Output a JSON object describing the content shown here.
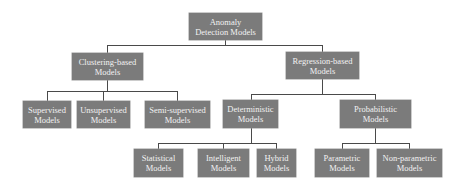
{
  "diagram": {
    "type": "tree",
    "root": {
      "id": "root",
      "line1": "Anomaly",
      "line2": "Detection Models"
    },
    "level1": [
      {
        "id": "clustering",
        "line1": "Clustering-based",
        "line2": "Models"
      },
      {
        "id": "regression",
        "line1": "Regression-based",
        "line2": "Models"
      }
    ],
    "level2_clustering": [
      {
        "id": "supervised",
        "line1": "Supervised",
        "line2": "Models"
      },
      {
        "id": "unsupervised",
        "line1": "Unsupervised",
        "line2": "Models"
      },
      {
        "id": "semi-supervised",
        "line1": "Semi-supervised",
        "line2": "Models"
      }
    ],
    "level2_regression": [
      {
        "id": "deterministic",
        "line1": "Deterministic",
        "line2": "Models"
      },
      {
        "id": "probabilistic",
        "line1": "Probabilistic",
        "line2": "Models"
      }
    ],
    "level3_deterministic": [
      {
        "id": "statistical",
        "line1": "Statistical",
        "line2": "Models"
      },
      {
        "id": "intelligent",
        "line1": "Intelligent",
        "line2": "Models"
      },
      {
        "id": "hybrid",
        "line1": "Hybrid",
        "line2": "Models"
      }
    ],
    "level3_probabilistic": [
      {
        "id": "parametric",
        "line1": "Parametric",
        "line2": "Models"
      },
      {
        "id": "non-parametric",
        "line1": "Non-parametric",
        "line2": "Models"
      }
    ],
    "colors": {
      "node_fill": "#7b7b7b",
      "node_text": "#f2f2f2",
      "connector": "#4a4a4a",
      "background": "#ffffff"
    }
  }
}
